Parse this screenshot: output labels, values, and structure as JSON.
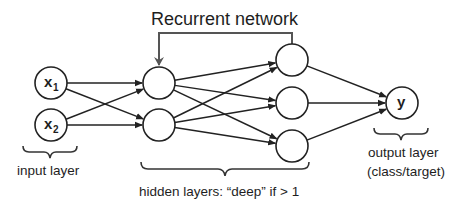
{
  "title": "Recurrent network",
  "layers": {
    "input": {
      "caption": "input layer",
      "nodes": [
        {
          "id": "x1",
          "label": "x",
          "sub": "1",
          "cx": 51,
          "cy": 83
        },
        {
          "id": "x2",
          "label": "x",
          "sub": "2",
          "cx": 51,
          "cy": 125
        }
      ]
    },
    "hidden1": {
      "nodes": [
        {
          "id": "h1a",
          "cx": 159,
          "cy": 83
        },
        {
          "id": "h1b",
          "cx": 159,
          "cy": 125
        }
      ]
    },
    "hidden2": {
      "nodes": [
        {
          "id": "h2a",
          "cx": 292,
          "cy": 60
        },
        {
          "id": "h2b",
          "cx": 292,
          "cy": 103
        },
        {
          "id": "h2c",
          "cx": 292,
          "cy": 146
        }
      ]
    },
    "hidden_caption": "hidden layers: “deep” if > 1",
    "output": {
      "caption_line1": "output layer",
      "caption_line2": "(class/target)",
      "nodes": [
        {
          "id": "y",
          "label": "y",
          "cx": 402,
          "cy": 103
        }
      ]
    }
  },
  "node_radius": 16,
  "edges": [
    [
      "x1",
      "h1a"
    ],
    [
      "x1",
      "h1b"
    ],
    [
      "x2",
      "h1a"
    ],
    [
      "x2",
      "h1b"
    ],
    [
      "h1a",
      "h2a"
    ],
    [
      "h1a",
      "h2b"
    ],
    [
      "h1a",
      "h2c"
    ],
    [
      "h1b",
      "h2a"
    ],
    [
      "h1b",
      "h2b"
    ],
    [
      "h1b",
      "h2c"
    ],
    [
      "h2a",
      "y"
    ],
    [
      "h2b",
      "y"
    ],
    [
      "h2c",
      "y"
    ]
  ],
  "recurrent_edge": {
    "from": "h2a",
    "to": "h1a",
    "top_y": 33
  },
  "colors": {
    "stroke": "#222222",
    "loop": "#555555",
    "text": "#1e1e1e",
    "background": "#ffffff"
  }
}
